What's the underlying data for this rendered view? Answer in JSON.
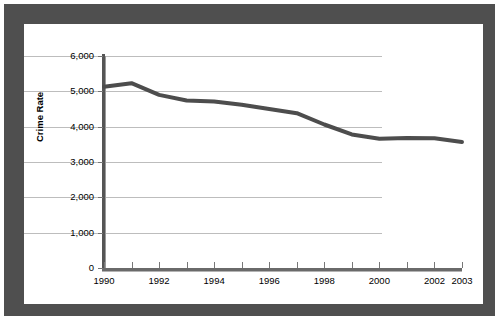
{
  "figure": {
    "frame_color": "#4f4f4f",
    "background_color": "#ffffff",
    "plot_background_color": "#ffffff"
  },
  "axes": {
    "y_title": "Crime Rate",
    "y_ticks": [
      "0",
      "1,000",
      "2,000",
      "3,000",
      "4,000",
      "5,000",
      "6,000"
    ],
    "x_ticks_visible": [
      "1990",
      "1992",
      "1994",
      "1996",
      "1998",
      "2000",
      "2002",
      "2003"
    ]
  },
  "chart_data": {
    "type": "line",
    "title": "",
    "xlabel": "",
    "ylabel": "Crime Rate",
    "xlim": [
      1990,
      2003
    ],
    "ylim": [
      0,
      6000
    ],
    "ytick_values": [
      0,
      1000,
      2000,
      3000,
      4000,
      5000,
      6000
    ],
    "ytick_labels": [
      "0",
      "1,000",
      "2,000",
      "3,000",
      "4,000",
      "5,000",
      "6,000"
    ],
    "xtick_values": [
      1990,
      1991,
      1992,
      1993,
      1994,
      1995,
      1996,
      1997,
      1998,
      1999,
      2000,
      2001,
      2002,
      2003
    ],
    "xtick_labels": [
      "1990",
      "",
      "1992",
      "",
      "1994",
      "",
      "1996",
      "",
      "1998",
      "",
      "2000",
      "",
      "2002",
      "2003"
    ],
    "grid": "horizontal",
    "legend": "none",
    "series": [
      {
        "name": "Crime Rate",
        "color": "#4d4d4d",
        "line_width": 4,
        "x": [
          1990,
          1991,
          1992,
          1993,
          1994,
          1995,
          1996,
          1997,
          1998,
          1999,
          2000,
          2001,
          2002,
          2003
        ],
        "values": [
          5130,
          5230,
          4900,
          4740,
          4710,
          4620,
          4500,
          4380,
          4060,
          3780,
          3660,
          3680,
          3670,
          3570
        ]
      }
    ]
  }
}
